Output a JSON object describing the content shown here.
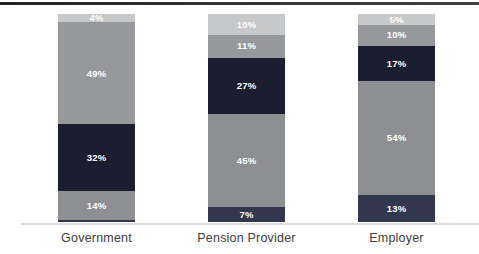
{
  "page": {
    "background_color": "#ffffff",
    "top_rule_color": "#2e3034",
    "baseline_color": "#dcdcdc",
    "data_label_color": "#ffffff",
    "category_label_color": "#3d3d3d"
  },
  "chart_data": {
    "type": "bar",
    "subtype": "100-percent-stacked-column",
    "title": "",
    "xlabel": "",
    "ylabel": "",
    "legend": "none",
    "gridlines": false,
    "value_suffix": "%",
    "categories": [
      "Government",
      "Pension Provider",
      "Employer"
    ],
    "series": [
      {
        "name": "bottom-navy-segment",
        "color": "#33374e",
        "values": [
          1,
          7,
          13
        ],
        "data_labels": [
          "",
          "7%",
          "13%"
        ]
      },
      {
        "name": "lower-gray-segment",
        "color": "#8d8f92",
        "values": [
          14,
          45,
          54
        ],
        "data_labels": [
          "14%",
          "45%",
          "54%"
        ]
      },
      {
        "name": "dark-navy-segment",
        "color": "#1b1e30",
        "values": [
          32,
          27,
          17
        ],
        "data_labels": [
          "32%",
          "27%",
          "17%"
        ]
      },
      {
        "name": "upper-gray-segment",
        "color": "#96989b",
        "values": [
          49,
          11,
          10
        ],
        "data_labels": [
          "49%",
          "11%",
          "10%"
        ]
      },
      {
        "name": "light-gray-top-segment",
        "color": "#c6c8ca",
        "values": [
          4,
          10,
          5
        ],
        "data_labels": [
          "4%",
          "10%",
          "5%"
        ]
      }
    ]
  }
}
